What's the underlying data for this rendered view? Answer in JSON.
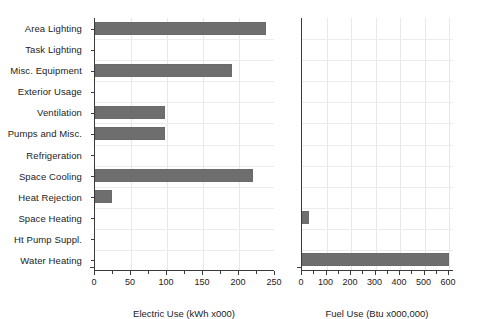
{
  "chart_data": {
    "type": "bar",
    "orientation": "horizontal",
    "title": "",
    "grid": true,
    "legend": "none",
    "categories": [
      "Area Lighting",
      "Task Lighting",
      "Misc. Equipment",
      "Exterior Usage",
      "Ventilation",
      "Pumps and Misc.",
      "Refrigeration",
      "Space Cooling",
      "Heat Rejection",
      "Space Heating",
      "Ht Pump Suppl.",
      "Water Heating"
    ],
    "panels": [
      {
        "name": "electric",
        "xlabel": "Electric Use (kWh x000)",
        "ylabel": "",
        "xlim": [
          0,
          250
        ],
        "xticks": [
          0,
          50,
          100,
          150,
          200,
          250
        ],
        "xticklabels": [
          "0",
          "50",
          "100",
          "150",
          "200",
          "250"
        ],
        "xminorticks": [
          25,
          75,
          125,
          175,
          225
        ],
        "values": [
          238,
          0,
          190,
          0,
          97,
          97,
          0,
          220,
          24,
          0,
          0,
          0
        ]
      },
      {
        "name": "fuel",
        "xlabel": "Fuel Use (Btu x000,000)",
        "ylabel": "",
        "xlim": [
          0,
          620
        ],
        "xticks": [
          0,
          100,
          200,
          300,
          400,
          500,
          600
        ],
        "xticklabels": [
          "0",
          "100",
          "200",
          "300",
          "400",
          "500",
          "600"
        ],
        "xminorticks": [
          50,
          150,
          250,
          350,
          450,
          550
        ],
        "values": [
          0,
          0,
          0,
          0,
          0,
          0,
          0,
          0,
          0,
          28,
          0,
          600
        ]
      }
    ],
    "colors": {
      "bar": "#6e6e6e",
      "axis": "#3a3a3a",
      "grid": "#e8e8e8",
      "background": "#ffffff",
      "text": "#1c1c1c"
    }
  }
}
